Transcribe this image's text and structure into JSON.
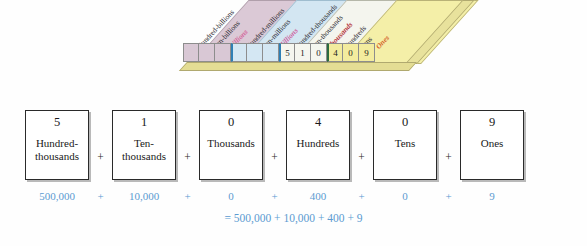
{
  "chart": {
    "columns": [
      {
        "label": "Hundred-billions",
        "digit": "",
        "group": "billions",
        "label_style": "plain"
      },
      {
        "label": "Ten-billions",
        "digit": "",
        "group": "billions",
        "label_style": "plain"
      },
      {
        "label": "Billions",
        "digit": "",
        "group": "billions",
        "label_style": "group"
      },
      {
        "label": "Hundred-millions",
        "digit": "",
        "group": "millions",
        "label_style": "plain"
      },
      {
        "label": "Ten-millions",
        "digit": "",
        "group": "millions",
        "label_style": "plain"
      },
      {
        "label": "Millions",
        "digit": "",
        "group": "millions",
        "label_style": "group"
      },
      {
        "label": "Hundred-thousands",
        "digit": "5",
        "group": "thousands",
        "label_style": "plain"
      },
      {
        "label": "Ten-thousands",
        "digit": "1",
        "group": "thousands",
        "label_style": "plain"
      },
      {
        "label": "Thousands",
        "digit": "0",
        "group": "thousands",
        "label_style": "group"
      },
      {
        "label": "Hundreds",
        "digit": "4",
        "group": "ones",
        "label_style": "plain"
      },
      {
        "label": "Tens",
        "digit": "0",
        "group": "ones",
        "label_style": "plain"
      },
      {
        "label": "Ones",
        "digit": "9",
        "group": "ones",
        "label_style": "group"
      }
    ],
    "group_label_colors": {
      "billions": "#d4679c",
      "millions": "#cf5fa0",
      "thousands": "#b4343a",
      "ones": "#d4652a"
    },
    "group_cell_colors": {
      "billions": "#d9c8d5",
      "millions": "#d4e7f3",
      "thousands": "#f5f6ef",
      "ones": "#f3ec9e"
    }
  },
  "expanded_form": {
    "plus_symbol": "+",
    "terms": [
      {
        "digit": "5",
        "place_line1": "Hundred-",
        "place_line2": "thousands",
        "value": "500,000"
      },
      {
        "digit": "1",
        "place_line1": "Ten-",
        "place_line2": "thousands",
        "value": "10,000"
      },
      {
        "digit": "0",
        "place_line1": "Thousands",
        "place_line2": "",
        "value": "0"
      },
      {
        "digit": "4",
        "place_line1": "Hundreds",
        "place_line2": "",
        "value": "400"
      },
      {
        "digit": "0",
        "place_line1": "Tens",
        "place_line2": "",
        "value": "0"
      },
      {
        "digit": "9",
        "place_line1": "Ones",
        "place_line2": "",
        "value": "9"
      }
    ]
  },
  "total_line": "= 500,000 + 10,000 + 400 + 9",
  "colors": {
    "value_blue": "#5b9bd1",
    "box_border": "#2a2a2a",
    "background": "#fefefe"
  }
}
